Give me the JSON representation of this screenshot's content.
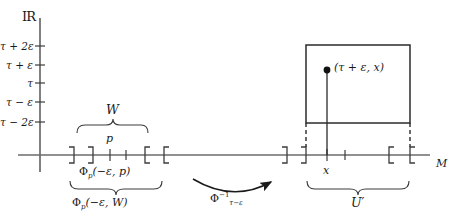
{
  "figure": {
    "title_symbol": "IR",
    "axes": {
      "vertical_axis_label": "IR",
      "horizontal_axis_label": "M"
    },
    "y_ticks": [
      {
        "label": "τ + 2ε"
      },
      {
        "label": "τ + ε"
      },
      {
        "label": "τ"
      },
      {
        "label": "τ − ε"
      },
      {
        "label": "τ − 2ε"
      }
    ],
    "left_region": {
      "brace_top_label": "W",
      "point_label": "p",
      "brace_mid_label": "Φ",
      "brace_mid_sub": "p",
      "brace_mid_arg": "(−ε, p)",
      "brace_bottom_label": "Φ",
      "brace_bottom_sub": "p",
      "brace_bottom_arg": "(−ε, W)"
    },
    "arrow": {
      "label_base": "Φ",
      "label_sup": "−1",
      "label_sub": "τ−ε"
    },
    "right_region": {
      "point_x_label": "x",
      "brace_label": "U",
      "brace_label_prime": "′",
      "box_point_label": "(τ + ε, x)"
    },
    "colors": {
      "ink": "#1a1a1a",
      "line": "#555555",
      "background": "#ffffff"
    }
  }
}
